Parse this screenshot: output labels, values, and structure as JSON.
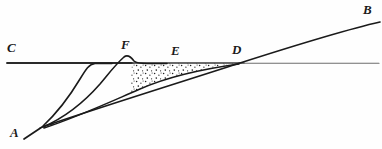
{
  "figure": {
    "background_color": "#fefefe",
    "ink_color": "#1a1a1a",
    "horizon_color": "#555555",
    "stipple_color": "#222222",
    "width": 382,
    "height": 149,
    "labels": [
      {
        "id": "A",
        "text": "A",
        "x": 10,
        "y": 126,
        "role": "origin-point-label"
      },
      {
        "id": "B",
        "text": "B",
        "x": 363,
        "y": 3,
        "role": "terminus-point-label"
      },
      {
        "id": "C",
        "text": "C",
        "x": 7,
        "y": 41,
        "role": "horizon-line-label"
      },
      {
        "id": "D",
        "text": "D",
        "x": 232,
        "y": 43,
        "role": "intersection-point-label"
      },
      {
        "id": "E",
        "text": "E",
        "x": 171,
        "y": 44,
        "role": "deposit-edge-label"
      },
      {
        "id": "F",
        "text": "F",
        "x": 121,
        "y": 38,
        "role": "crest-point-label"
      }
    ],
    "geometry": {
      "horizon_line": {
        "name": "horizontal-datum-line-C",
        "y": 63,
        "x_start": 7,
        "x_end": 379
      },
      "slope_curve_AB": {
        "name": "main-slope-curve-A-to-B",
        "path": "M 24,139 L 42,127 C 110,104 175,84 240,63 C 290,47 340,31 380,22"
      },
      "inner_curve_1": {
        "name": "inner-profile-curve-1",
        "path": "M 43,126 C 58,112 72,92 81,78 C 87,69 90,65 95,64 L 110,64"
      },
      "inner_curve_2": {
        "name": "inner-profile-curve-2-with-crest-F",
        "path": "M 43,127 C 66,117 86,100 100,84 C 110,72 116,64 124,58 C 128,55 131,57 134,61 C 137,64 140,64 146,64 L 166,64"
      },
      "deposit_lower_boundary": {
        "name": "deposit-lower-boundary-curve",
        "path": "M 44,128 C 80,116 112,101 140,89 C 165,78 195,70 239,64"
      },
      "deposit_upper_boundary": {
        "name": "deposit-upper-boundary-horizon-segment",
        "path": "M 132,63 L 239,63"
      },
      "stipple_region": {
        "name": "stippled-sediment-wedge",
        "description": "dotted wedge between horizon line and deposit lower boundary, from F to D",
        "dot_count": 150
      }
    }
  }
}
